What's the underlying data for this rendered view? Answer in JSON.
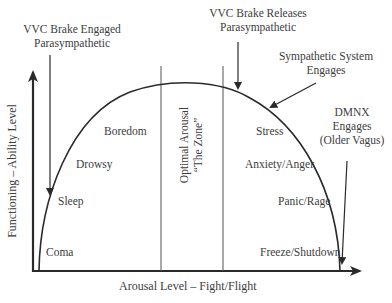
{
  "diagram": {
    "type": "inverted-u arousal curve",
    "axes": {
      "x_label": "Arousal Level – Fight/Flight",
      "y_label": "Functioning – Ability Level"
    },
    "annotations": {
      "vvc_engaged": {
        "line1": "VVC Brake Engaged",
        "line2": "Parasympathetic"
      },
      "vvc_releases": {
        "line1": "VVC Brake Releases",
        "line2": "Parasympathetic"
      },
      "sympathetic": {
        "line1": "Sympathetic System",
        "line2": "Engages"
      },
      "dmnx": {
        "line1": "DMNX",
        "line2": "Engages",
        "line3": "(Older Vagus)"
      }
    },
    "zone": {
      "line1": "Optimal Arousal",
      "line2": "“The Zone”"
    },
    "left_states": [
      "Boredom",
      "Drowsy",
      "Sleep",
      "Coma"
    ],
    "right_states": [
      "Stress",
      "Anxiety/Anger",
      "Panic/Rage",
      "Freeze/Shutdown"
    ],
    "colors": {
      "line": "#2a2a2a",
      "text": "#3d3d3d",
      "background": "#ffffff"
    }
  }
}
